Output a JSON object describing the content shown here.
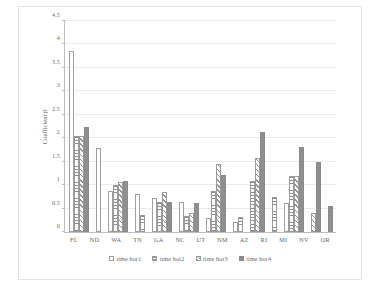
{
  "chart_data": {
    "type": "bar",
    "title": "",
    "xlabel": "",
    "ylabel": "Coefficient β",
    "ylim": [
      0,
      4.5
    ],
    "ytick_values": [
      0,
      0.5,
      1,
      1.5,
      2,
      2.5,
      3,
      3.5,
      4,
      4.5
    ],
    "ytick_labels": [
      "0",
      "0.5",
      "1",
      "1.5",
      "2",
      "2.5",
      "3",
      "3.5",
      "4",
      "4.5"
    ],
    "grid": true,
    "legend_position": "bottom",
    "categories": [
      "FL",
      "ND",
      "WA",
      "TN",
      "GA",
      "NC",
      "UT",
      "NM",
      "AZ",
      "RI",
      "MI",
      "NV",
      "OR"
    ],
    "series": [
      {
        "name": "time hor1",
        "fill": "open",
        "values": [
          3.85,
          1.8,
          0.87,
          0.82,
          0.72,
          0.65,
          0.29,
          0.22,
          null,
          null,
          0.61,
          null,
          null
        ]
      },
      {
        "name": "time hor2",
        "fill": "horizontal-stripe",
        "values": [
          2.05,
          null,
          1.0,
          0.37,
          0.64,
          0.34,
          0.87,
          0.31,
          1.09,
          0.75,
          1.2,
          null,
          null
        ]
      },
      {
        "name": "time hor3",
        "fill": "diagonal-hatch",
        "values": [
          2.05,
          null,
          1.06,
          null,
          0.85,
          0.4,
          1.46,
          null,
          1.57,
          null,
          1.2,
          0.4,
          null
        ]
      },
      {
        "name": "time hor4",
        "fill": "solid",
        "values": [
          2.25,
          null,
          1.08,
          null,
          0.65,
          0.62,
          1.21,
          null,
          2.14,
          null,
          1.82,
          1.49,
          0.55
        ]
      }
    ]
  },
  "colors": {
    "solid_fill": "#8f8f8f",
    "bar_outline": "#9a9a9a",
    "gridline": "#e9e9e9",
    "axis": "#bdbdbd",
    "text": "#5a5a5a",
    "background": "#ffffff",
    "frame": "#e3e3e3"
  }
}
